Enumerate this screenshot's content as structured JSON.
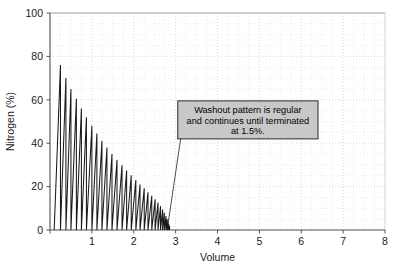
{
  "chart_data": {
    "type": "line",
    "title": "",
    "xlabel": "Volume",
    "ylabel": "Nitrogen (%)",
    "xlim": [
      0,
      8
    ],
    "ylim": [
      0,
      100
    ],
    "xticks": [
      0,
      1,
      2,
      3,
      4,
      5,
      6,
      7,
      8
    ],
    "xticklabels": [
      "",
      "1",
      "2",
      "3",
      "4",
      "5",
      "6",
      "7",
      "8"
    ],
    "yticks": [
      0,
      20,
      40,
      60,
      80,
      100
    ],
    "yticklabels": [
      "0",
      "20",
      "40",
      "60",
      "80",
      "100"
    ],
    "grid": true,
    "grid_style": "dotted-minor",
    "legend": "none",
    "series": [
      {
        "name": "Nitrogen washout (sawtooth breaths)",
        "description": "Each breath rises from 0 to a peak then drops vertically back to 0; peak amplitudes decay exponentially.",
        "breaths": [
          {
            "start": 0.1,
            "peak_x": 0.25,
            "peak_y": 76.0
          },
          {
            "start": 0.25,
            "peak_x": 0.38,
            "peak_y": 70.0
          },
          {
            "start": 0.38,
            "peak_x": 0.5,
            "peak_y": 65.0
          },
          {
            "start": 0.5,
            "peak_x": 0.63,
            "peak_y": 60.5
          },
          {
            "start": 0.63,
            "peak_x": 0.75,
            "peak_y": 56.0
          },
          {
            "start": 0.75,
            "peak_x": 0.87,
            "peak_y": 52.0
          },
          {
            "start": 0.87,
            "peak_x": 1.0,
            "peak_y": 48.0
          },
          {
            "start": 1.0,
            "peak_x": 1.12,
            "peak_y": 44.5
          },
          {
            "start": 1.12,
            "peak_x": 1.24,
            "peak_y": 41.0
          },
          {
            "start": 1.24,
            "peak_x": 1.36,
            "peak_y": 38.0
          },
          {
            "start": 1.36,
            "peak_x": 1.48,
            "peak_y": 35.0
          },
          {
            "start": 1.48,
            "peak_x": 1.6,
            "peak_y": 32.3
          },
          {
            "start": 1.6,
            "peak_x": 1.72,
            "peak_y": 29.8
          },
          {
            "start": 1.72,
            "peak_x": 1.83,
            "peak_y": 27.4
          },
          {
            "start": 1.83,
            "peak_x": 1.94,
            "peak_y": 25.2
          },
          {
            "start": 1.94,
            "peak_x": 2.05,
            "peak_y": 23.0
          },
          {
            "start": 2.05,
            "peak_x": 2.15,
            "peak_y": 21.0
          },
          {
            "start": 2.15,
            "peak_x": 2.25,
            "peak_y": 19.2
          },
          {
            "start": 2.25,
            "peak_x": 2.34,
            "peak_y": 17.4
          },
          {
            "start": 2.34,
            "peak_x": 2.43,
            "peak_y": 15.8
          },
          {
            "start": 2.43,
            "peak_x": 2.51,
            "peak_y": 14.2
          },
          {
            "start": 2.51,
            "peak_x": 2.58,
            "peak_y": 12.6
          },
          {
            "start": 2.58,
            "peak_x": 2.64,
            "peak_y": 11.0
          },
          {
            "start": 2.64,
            "peak_x": 2.69,
            "peak_y": 9.4
          },
          {
            "start": 2.69,
            "peak_x": 2.73,
            "peak_y": 7.9
          },
          {
            "start": 2.73,
            "peak_x": 2.77,
            "peak_y": 6.4
          },
          {
            "start": 2.77,
            "peak_x": 2.8,
            "peak_y": 5.0
          },
          {
            "start": 2.8,
            "peak_x": 2.82,
            "peak_y": 3.8
          },
          {
            "start": 2.82,
            "peak_x": 2.84,
            "peak_y": 2.7
          },
          {
            "start": 2.84,
            "peak_x": 2.855,
            "peak_y": 1.8
          }
        ]
      }
    ],
    "annotations": [
      {
        "name": "washout-note",
        "lines": [
          "Washout pattern is regular",
          "and continues until terminated",
          "at 1.5%."
        ],
        "box": {
          "x0": 3.05,
          "x1": 6.4,
          "y0": 42.0,
          "y1": 59.5
        },
        "leader": {
          "x0": 3.12,
          "y0": 42.0,
          "x1": 2.82,
          "y1": 3.0
        }
      }
    ]
  },
  "colors": {
    "data_line": "#1a1a1a",
    "axis": "#555555",
    "grid": "#cfcfcf",
    "annotation_fill": "#c8c8c8",
    "annotation_border": "#3a3a3a",
    "text": "#1a1a1a",
    "background": "#ffffff"
  }
}
